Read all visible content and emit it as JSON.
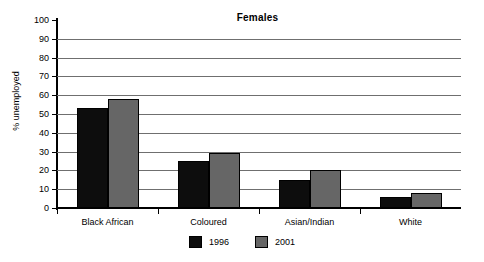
{
  "chart_data": {
    "type": "bar",
    "title": "Females",
    "xlabel": "",
    "ylabel": "% unemployed",
    "ylim": [
      0,
      100
    ],
    "ytick_step": 10,
    "grid": true,
    "legend_position": "bottom",
    "categories": [
      "Black African",
      "Coloured",
      "Asian/Indian",
      "White"
    ],
    "series": [
      {
        "name": "1996",
        "color": "#0d0d0d",
        "values": [
          53,
          25,
          15,
          6
        ]
      },
      {
        "name": "2001",
        "color": "#666666",
        "values": [
          58,
          29,
          20,
          8
        ]
      }
    ],
    "ytick_labels": [
      "0",
      "10",
      "20",
      "30",
      "40",
      "50",
      "60",
      "70",
      "80",
      "90",
      "100"
    ]
  }
}
